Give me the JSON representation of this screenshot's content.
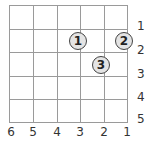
{
  "grid": {
    "columns": 5,
    "rows": 5,
    "column_labels": [
      "6",
      "5",
      "4",
      "3",
      "2",
      "1"
    ],
    "row_labels": [
      "1",
      "2",
      "3",
      "4",
      "5"
    ]
  },
  "markers": [
    {
      "label": "1",
      "x": 78,
      "y": 41
    },
    {
      "label": "2",
      "x": 124,
      "y": 41
    },
    {
      "label": "3",
      "x": 101,
      "y": 65
    }
  ],
  "colors": {
    "grid_line": "#9a9a9a",
    "marker_fill": "#e4e4e4",
    "marker_border": "#444444"
  }
}
